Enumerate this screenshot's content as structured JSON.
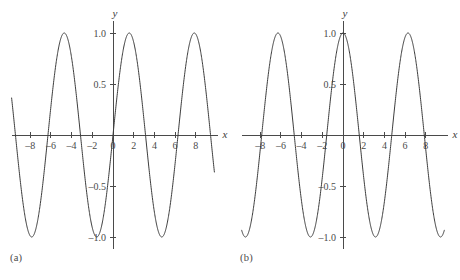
{
  "figure": {
    "background_color": "#ffffff",
    "curve_color": "#3c3c3c",
    "axis_color": "#4a4a4a",
    "panels": [
      {
        "id": "a",
        "caption": "(a)",
        "x_axis_label": "x",
        "y_axis_label": "y"
      },
      {
        "id": "b",
        "caption": "(b)",
        "x_axis_label": "x",
        "y_axis_label": "y"
      }
    ]
  },
  "chart_data": [
    {
      "type": "line",
      "title": "",
      "subtitle": "",
      "panel": "(a)",
      "function": "sin(x)",
      "xlabel": "x",
      "ylabel": "y",
      "xlim": [
        -9.8,
        9.8
      ],
      "ylim": [
        -1.12,
        1.12
      ],
      "grid": false,
      "legend": null,
      "xticks": [
        -8,
        -6,
        -4,
        -2,
        0,
        2,
        4,
        6,
        8
      ],
      "xticklabels": [
        "–8",
        "–6",
        "–4",
        "–2",
        "0",
        "2",
        "4",
        "6",
        "8"
      ],
      "yticks": [
        1.0,
        0.5,
        -0.5,
        -1.0
      ],
      "yticklabels": [
        "1.0",
        "0.5",
        "–0.5",
        "–1.0"
      ],
      "peaks_x": [
        -11.0,
        -4.7,
        1.6,
        7.9
      ],
      "troughs_x": [
        -7.9,
        -1.6,
        4.7
      ],
      "zero_crossings_x": [
        -9.4,
        -6.3,
        -3.1,
        0,
        3.1,
        6.3,
        9.4
      ],
      "period": 6.283,
      "amplitude": 1.0
    },
    {
      "type": "line",
      "title": "",
      "subtitle": "",
      "panel": "(b)",
      "function": "cos(x)",
      "xlabel": "x",
      "ylabel": "y",
      "xlim": [
        -9.8,
        9.8
      ],
      "ylim": [
        -1.12,
        1.12
      ],
      "grid": false,
      "legend": null,
      "xticks": [
        -8,
        -6,
        -4,
        -2,
        0,
        2,
        4,
        6,
        8
      ],
      "xticklabels": [
        "–8",
        "–6",
        "–4",
        "–2",
        "0",
        "2",
        "4",
        "6",
        "8"
      ],
      "yticks": [
        1.0,
        0.5,
        -0.5,
        -1.0
      ],
      "yticklabels": [
        "1.0",
        "0.5",
        "–0.5",
        "–1.0"
      ],
      "peaks_x": [
        -6.3,
        0,
        6.3
      ],
      "troughs_x": [
        -9.4,
        -3.1,
        3.1,
        9.4
      ],
      "zero_crossings_x": [
        -7.9,
        -4.7,
        -1.6,
        1.6,
        4.7,
        7.9
      ],
      "period": 6.283,
      "amplitude": 1.0
    }
  ]
}
